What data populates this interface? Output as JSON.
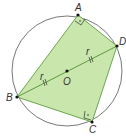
{
  "diagram": {
    "type": "cyclic-quadrilateral",
    "circle": {
      "center": "O",
      "cx": 67,
      "cy": 71,
      "r": 55
    },
    "points": {
      "A": {
        "label": "A",
        "x": 78,
        "y": 15
      },
      "B": {
        "label": "B",
        "x": 17,
        "y": 97
      },
      "C": {
        "label": "C",
        "x": 92,
        "y": 122
      },
      "D": {
        "label": "D",
        "x": 117,
        "y": 46
      },
      "O": {
        "label": "O",
        "x": 67,
        "y": 71
      }
    },
    "radius_labels": [
      "r",
      "r"
    ],
    "right_angles": [
      "A",
      "C"
    ],
    "colors": {
      "fill": "#c9e6ac",
      "stroke": "#6aa84f",
      "circle": "#555555",
      "point": "#111111"
    }
  }
}
